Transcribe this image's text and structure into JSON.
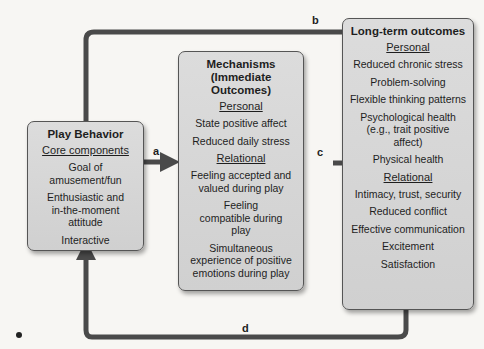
{
  "diagram": {
    "boxes": {
      "play": {
        "title": "Play Behavior",
        "section": "Core components",
        "items": [
          "Goal of amusement/fun",
          "Enthusiastic and in-the-moment attitude",
          "Interactive"
        ]
      },
      "mechanisms": {
        "title": "Mechanisms (Immediate Outcomes)",
        "personal_label": "Personal",
        "personal": [
          "State positive affect",
          "Reduced daily stress"
        ],
        "relational_label": "Relational",
        "relational": [
          "Feeling accepted and valued during play",
          "Feeling compatible during play",
          "Simultaneous experience of positive emotions during play"
        ]
      },
      "longterm": {
        "title": "Long-term outcomes",
        "personal_label": "Personal",
        "personal": [
          "Reduced chronic stress",
          "Problem-solving",
          "Flexible thinking patterns",
          "Psychological health (e.g., trait positive affect)",
          "Physical health"
        ],
        "relational_label": "Relational",
        "relational": [
          "Intimacy, trust, security",
          "Reduced conflict",
          "Effective communication",
          "Excitement",
          "Satisfaction"
        ]
      }
    },
    "arrows": {
      "a": "a",
      "b": "b",
      "c": "c",
      "d": "d"
    },
    "colors": {
      "box_fill": "#d6d6d6",
      "arrow": "#4a4a4a",
      "background": "#f7f6f3"
    }
  }
}
